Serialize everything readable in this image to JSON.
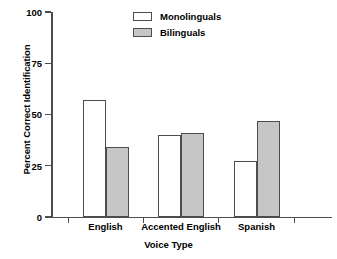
{
  "chart_data": {
    "type": "bar",
    "title": "",
    "xlabel": "Voice Type",
    "ylabel": "Percent Correct Identification",
    "categories": [
      "English",
      "Accented English",
      "Spanish"
    ],
    "series": [
      {
        "name": "Monolinguals",
        "values": [
          57,
          40,
          27.5
        ],
        "color": "#ffffff"
      },
      {
        "name": "Bilinguals",
        "values": [
          34,
          41,
          47
        ],
        "color": "#c6c6c6"
      }
    ],
    "ylim": [
      0,
      100
    ],
    "yticks": [
      0,
      25,
      50,
      75,
      100
    ],
    "ytick_labels": [
      "0",
      "25",
      "50",
      "75",
      "100"
    ],
    "grid": false,
    "legend_position": "top-center"
  },
  "legend": {
    "items": [
      {
        "label": "Monolinguals",
        "swatch": "white-swatch"
      },
      {
        "label": "Bilinguals",
        "swatch": "gray-swatch"
      }
    ]
  },
  "colors": {
    "axis": "#4d4d4d",
    "monolinguals": "#ffffff",
    "bilinguals": "#c6c6c6",
    "background": "#ffffff"
  }
}
